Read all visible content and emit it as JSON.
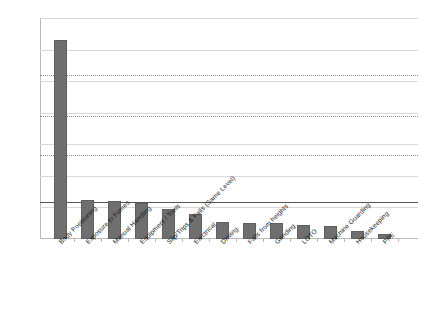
{
  "chart_data": {
    "type": "bar",
    "title": "",
    "subtitle": "",
    "xlabel": "",
    "ylabel": "",
    "ylim": [
      0,
      70
    ],
    "yticks": [
      0,
      10,
      20,
      30,
      40,
      50,
      60,
      70
    ],
    "grid": true,
    "legend": "none",
    "orientation": "vertical",
    "bar_color": "#6f6f6f",
    "categories": [
      "Body Positioning",
      "Exposure to Fumes",
      "Manual Handling",
      "Equipment / Tools",
      "Slip/Trips & Falls (Same Level)",
      "Electrical",
      "Driving",
      "Falls from heights",
      "Grinding",
      "LOTO",
      "Machine Guarding",
      "Housekeeping",
      "PPE"
    ],
    "values": [
      63,
      12.5,
      12,
      11.5,
      9.5,
      8,
      5.5,
      5,
      5,
      4.5,
      4,
      2.5,
      1.5
    ],
    "reference_lines": [
      {
        "value": 52,
        "style": "dotted",
        "color": "#8d8d8d"
      },
      {
        "value": 39,
        "style": "dotted",
        "color": "#8d8d8d"
      },
      {
        "value": 26.5,
        "style": "dotted",
        "color": "#8d8d8d"
      },
      {
        "value": 11.7,
        "style": "solid",
        "color": "#555555"
      }
    ]
  }
}
